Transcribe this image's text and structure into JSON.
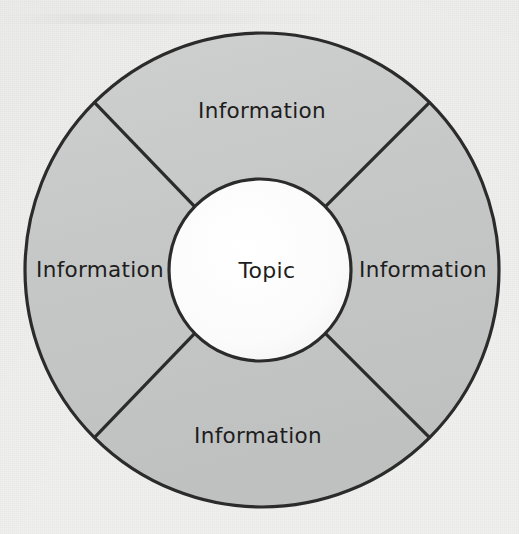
{
  "diagram": {
    "type": "circular-wheel-diagram",
    "center": {
      "label": "Topic",
      "fill_color": "#fdfdfd",
      "stroke_color": "#2b2b2b"
    },
    "ring": {
      "fill_color": "#c5c6c6",
      "stroke_color": "#2b2b2b",
      "segment_count": 4
    },
    "background_color": "#f0f0ef",
    "segments": [
      {
        "position": "top",
        "label": "Information"
      },
      {
        "position": "right",
        "label": "Information"
      },
      {
        "position": "bottom",
        "label": "Information"
      },
      {
        "position": "left",
        "label": "Information"
      }
    ]
  }
}
